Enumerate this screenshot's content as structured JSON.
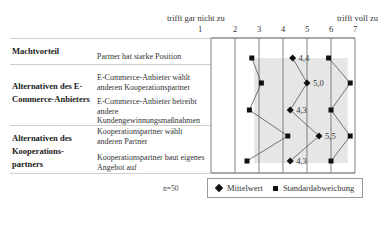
{
  "chart_data": {
    "type": "line",
    "title": "",
    "scale": {
      "min": 1,
      "max": 7,
      "ticks": [
        1,
        2,
        3,
        4,
        5,
        6,
        7
      ],
      "left_anchor_label": "trifft gar nicht zu",
      "right_anchor_label": "trifft voll zu"
    },
    "groups": [
      {
        "label": "Machtvorteil",
        "items": [
          "Partner hat starke Position"
        ]
      },
      {
        "label": "Alternativen des E-Commerce-Anbieters",
        "items": [
          "E-Commerce-Anbieter wählt anderen Kooperationspartner",
          "E-Commerce-Anbieter betreibt andere Kundengewinnungsmaßnahmen"
        ]
      },
      {
        "label": "Alternativen des Kooperationspartners",
        "items": [
          "Kooperationspartner wählt anderen Partner",
          "Kooperationspartner baut eigenes Angebot auf"
        ]
      }
    ],
    "categories": [
      "Partner hat starke Position",
      "E-Commerce-Anbieter wählt anderen Kooperationspartner",
      "E-Commerce-Anbieter betreibt andere Kundengewinnungsmaßnahmen",
      "Kooperationspartner wählt anderen Partner",
      "Kooperationspartner baut eigenes Angebot auf"
    ],
    "series": [
      {
        "name": "Mittelwert",
        "marker": "diamond",
        "values": [
          4.4,
          5.0,
          4.3,
          5.5,
          4.3
        ],
        "labels": [
          "4,4",
          "5,0",
          "4,3",
          "5,5",
          "4,3"
        ]
      },
      {
        "name": "Standardabweichung (unten)",
        "marker": "square",
        "values": [
          2.7,
          3.1,
          2.6,
          4.2,
          2.5
        ]
      },
      {
        "name": "Standardabweichung (oben)",
        "marker": "square",
        "values": [
          5.9,
          6.8,
          6.0,
          6.8,
          6.0
        ]
      }
    ],
    "legend": [
      "Mittelwert",
      "Standardabweichung"
    ],
    "legend_position": "bottom",
    "sample_size": "n=50",
    "grid": true
  },
  "header": {
    "left_anchor": "trifft gar nicht zu",
    "right_anchor": "trifft voll zu",
    "ticks": [
      "1",
      "2",
      "3",
      "4",
      "5",
      "6",
      "7"
    ]
  },
  "table": {
    "group1": "Machtvorteil",
    "group2": "Alternativen des E-Commerce-Anbieters",
    "group3": "Alternativen des Kooperations-partners",
    "item1": "Partner hat starke Position",
    "item2": "E-Commerce-Anbieter wählt anderen Kooperationspartner",
    "item3": "E-Commerce-Anbieter betreibt andere Kundengewinnungsmaßnahmen",
    "item4": "Kooperationspartner wählt anderen Partner",
    "item5": "Kooperationspartner baut eigenes Angebot auf"
  },
  "footer": {
    "n": "n=50",
    "legend_mean": "Mittelwert",
    "legend_sd": "Standardabweichung"
  }
}
